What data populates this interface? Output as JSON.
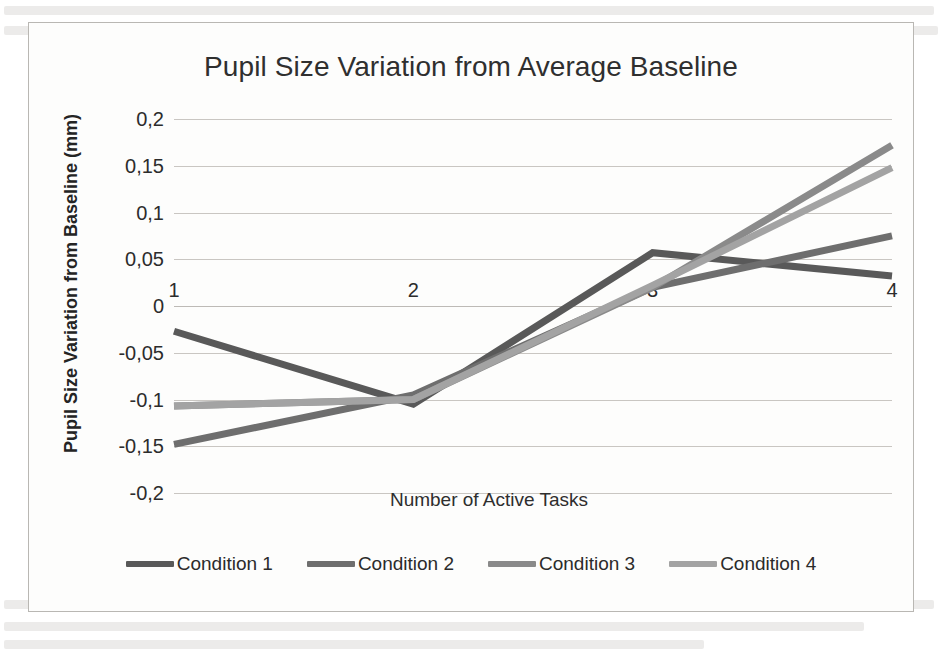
{
  "chart_data": {
    "type": "line",
    "title": "Pupil Size Variation from Average Baseline",
    "xlabel": "Number of Active Tasks",
    "ylabel": "Pupil Size Variation from Baseline (mm)",
    "categories": [
      "1",
      "2",
      "3",
      "4"
    ],
    "x": [
      1,
      2,
      3,
      4
    ],
    "ylim": [
      -0.2,
      0.2
    ],
    "yticks": [
      0.2,
      0.15,
      0.1,
      0.05,
      0,
      -0.05,
      -0.1,
      -0.15,
      -0.2
    ],
    "ytick_labels": [
      "0,2",
      "0,15",
      "0,1",
      "0,05",
      "0",
      "-0,05",
      "-0,1",
      "-0,15",
      "-0,2"
    ],
    "xtick_labels": [
      "1",
      "2",
      "3",
      "4"
    ],
    "grid": true,
    "legend_position": "bottom",
    "decimal_separator": ",",
    "series": [
      {
        "name": "Condition 1",
        "color": "#595959",
        "values": [
          -0.027,
          -0.105,
          0.057,
          0.032
        ]
      },
      {
        "name": "Condition 2",
        "color": "#6e6e6e",
        "values": [
          -0.148,
          -0.095,
          0.02,
          0.075
        ]
      },
      {
        "name": "Condition 3",
        "color": "#8a8a8a",
        "values": [
          -0.107,
          -0.1,
          0.02,
          0.172
        ]
      },
      {
        "name": "Condition 4",
        "color": "#a3a3a3",
        "values": [
          -0.107,
          -0.1,
          0.022,
          0.148
        ]
      }
    ]
  },
  "legend": {
    "items": [
      {
        "label": "Condition 1",
        "color": "#595959"
      },
      {
        "label": "Condition 2",
        "color": "#6e6e6e"
      },
      {
        "label": "Condition 3",
        "color": "#8a8a8a"
      },
      {
        "label": "Condition 4",
        "color": "#a3a3a3"
      }
    ]
  }
}
